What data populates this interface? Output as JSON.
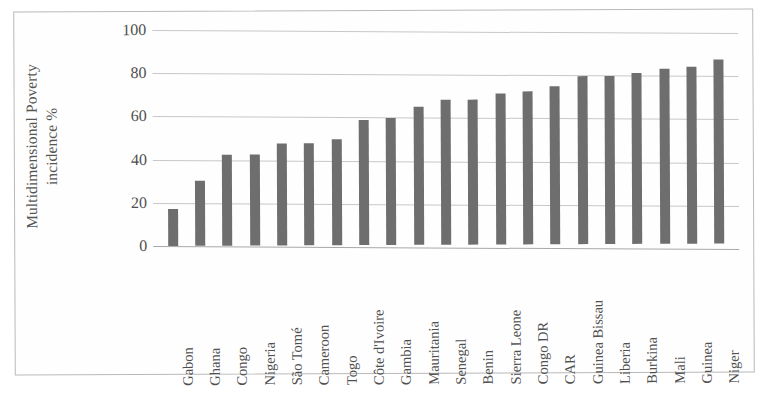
{
  "chart_data": {
    "type": "bar",
    "title": "",
    "subtitle": "",
    "xlabel": "",
    "ylabel": "Multidimensional Poverty incidence %",
    "ylabel_lines": [
      "Multidimensional Poverty",
      "incidence %"
    ],
    "ylim": [
      0,
      100
    ],
    "ytick_labels": [
      "100",
      "80",
      "60",
      "40",
      "20",
      "0"
    ],
    "ytick_values": [
      100,
      80,
      60,
      40,
      20,
      0
    ],
    "grid": true,
    "legend": false,
    "legend_position": "none",
    "bar_color": "#6e6e6e",
    "gridline_color": "#c8c8c8",
    "categories": [
      "Gabon",
      "Ghana",
      "Congo",
      "Nigeria",
      "São Tomé",
      "Cameroon",
      "Togo",
      "Côte d'Ivoire",
      "Gambia",
      "Mauritania",
      "Senegal",
      "Benin",
      "Sierra Leone",
      "Congo DR",
      "CAR",
      "Guinea Bissau",
      "Liberia",
      "Burkina",
      "Mali",
      "Guinea",
      "Niger"
    ],
    "values": [
      17,
      30,
      42,
      42,
      47,
      47,
      49,
      58,
      59,
      64,
      67,
      67,
      70,
      71,
      73,
      78,
      78,
      79,
      81,
      82,
      85
    ]
  }
}
